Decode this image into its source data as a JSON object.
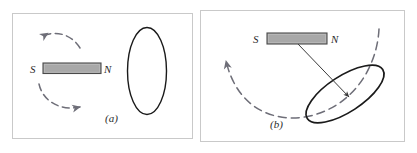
{
  "figure": {
    "caption_a": "(a)",
    "caption_b": "(b)",
    "panels": [
      {
        "id": "a",
        "label": "(a)",
        "magnet": {
          "south_pole_label": "S",
          "north_pole_label": "N",
          "fill_color": "#a8a8a8",
          "border_color": "#4a4a4a",
          "orientation": "horizontal"
        },
        "loop": {
          "shape": "ellipse",
          "orientation": "vertical",
          "stroke_color": "#1a1a1a"
        },
        "arrows": [
          {
            "name": "rotation-arrow-top",
            "direction": "left",
            "style": "dashed",
            "color": "#6e6e78"
          },
          {
            "name": "rotation-arrow-bottom",
            "direction": "right",
            "style": "dashed",
            "color": "#6e6e78"
          }
        ]
      },
      {
        "id": "b",
        "label": "(b)",
        "magnet": {
          "south_pole_label": "S",
          "north_pole_label": "N",
          "fill_color": "#a8a8a8",
          "border_color": "#4a4a4a",
          "orientation": "horizontal"
        },
        "loop": {
          "shape": "ellipse",
          "orientation": "tilted",
          "tilt_degrees": -35,
          "stroke_color": "#1a1a1a"
        },
        "arrows": [
          {
            "name": "field-direction-arrow",
            "direction": "down-right",
            "style": "solid",
            "color": "#3a3a3a"
          },
          {
            "name": "rotation-arc-arrow",
            "direction": "up-left",
            "style": "dashed",
            "color": "#6e6e78"
          }
        ]
      }
    ],
    "colors": {
      "frame": "#c9c9c9",
      "magnet_fill": "#a8a8a8",
      "magnet_border": "#4a4a4a",
      "loop_stroke": "#1a1a1a",
      "dashed_arrow": "#6e6e78",
      "solid_arrow": "#3a3a3a",
      "text": "#2b2b2b",
      "background": "#ffffff"
    }
  }
}
